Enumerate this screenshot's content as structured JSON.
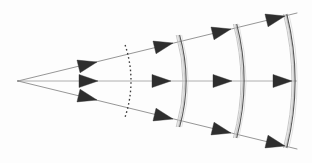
{
  "figure": {
    "type": "optics-wavefront-diagram",
    "canvas": {
      "width": 312,
      "height": 163
    },
    "background_color": "#fdfdfd",
    "source": {
      "label": "point-source",
      "x": 18,
      "y": 81
    },
    "colors": {
      "ray_line": "#8a8a8a",
      "arrow_fill": "#2e2e2e",
      "wavefront_dotted": "#3a3a3a",
      "wavefront_solid": "#5c5c5c",
      "wavefront_ghost": "#b4b4b4"
    },
    "rays": [
      {
        "name": "upper-ray",
        "angle_deg": -13.5,
        "x1": 18,
        "y1": 81,
        "x2": 297,
        "y2": 13
      },
      {
        "name": "axis-ray",
        "angle_deg": 0,
        "x1": 18,
        "y1": 81,
        "x2": 297,
        "y2": 81
      },
      {
        "name": "lower-ray",
        "angle_deg": 13.5,
        "x1": 18,
        "y1": 81,
        "x2": 297,
        "y2": 149
      }
    ],
    "wavefronts": [
      {
        "name": "wavefront-1",
        "style": "dotted",
        "radius": 113,
        "center_x": 18,
        "center_y": 81,
        "apex_x": 131,
        "top_y": 45,
        "bottom_y": 117
      },
      {
        "name": "wavefront-2",
        "style": "solid-bundle",
        "radius": 168,
        "center_x": 18,
        "center_y": 81,
        "apex_x": 186,
        "top_y": 35,
        "bottom_y": 127
      },
      {
        "name": "wavefront-3",
        "style": "solid-bundle",
        "radius": 226,
        "center_x": 18,
        "center_y": 81,
        "apex_x": 244,
        "top_y": 24,
        "bottom_y": 138
      },
      {
        "name": "wavefront-4",
        "style": "solid-bundle",
        "radius": 277,
        "center_x": 18,
        "center_y": 81,
        "apex_x": 295,
        "top_y": 14,
        "bottom_y": 148
      }
    ],
    "arrows": [
      {
        "name": "arrow-upper-1",
        "ray": "upper-ray",
        "tip_x": 97,
        "tip_y": 62,
        "angle_deg": -13.5
      },
      {
        "name": "arrow-axis-1",
        "ray": "axis-ray",
        "tip_x": 98,
        "tip_y": 81,
        "angle_deg": 0
      },
      {
        "name": "arrow-lower-1",
        "ray": "lower-ray",
        "tip_x": 97,
        "tip_y": 100,
        "angle_deg": 13.5
      },
      {
        "name": "arrow-upper-2",
        "ray": "upper-ray",
        "tip_x": 173,
        "tip_y": 43,
        "angle_deg": -13.5
      },
      {
        "name": "arrow-axis-2",
        "ray": "axis-ray",
        "tip_x": 171,
        "tip_y": 81,
        "angle_deg": 0
      },
      {
        "name": "arrow-lower-2",
        "ray": "lower-ray",
        "tip_x": 173,
        "tip_y": 119,
        "angle_deg": 13.5
      },
      {
        "name": "arrow-upper-3",
        "ray": "upper-ray",
        "tip_x": 231,
        "tip_y": 29,
        "angle_deg": -13.5
      },
      {
        "name": "arrow-axis-3",
        "ray": "axis-ray",
        "tip_x": 232,
        "tip_y": 81,
        "angle_deg": 0
      },
      {
        "name": "arrow-lower-3",
        "ray": "lower-ray",
        "tip_x": 231,
        "tip_y": 133,
        "angle_deg": 13.5
      },
      {
        "name": "arrow-upper-4",
        "ray": "upper-ray",
        "tip_x": 285,
        "tip_y": 16,
        "angle_deg": -13.5
      },
      {
        "name": "arrow-axis-4",
        "ray": "axis-ray",
        "tip_x": 292,
        "tip_y": 81,
        "angle_deg": 0
      },
      {
        "name": "arrow-lower-4",
        "ray": "lower-ray",
        "tip_x": 285,
        "tip_y": 146,
        "angle_deg": 13.5
      }
    ],
    "arrow_geometry": {
      "length": 19,
      "half_width": 6.5
    }
  }
}
